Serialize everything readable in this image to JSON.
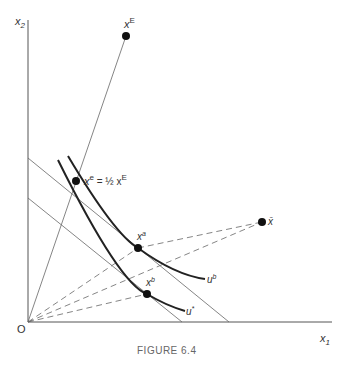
{
  "figure": {
    "caption": "FIGURE 6.4",
    "axes": {
      "origin_label": "O",
      "x_label": "x",
      "x_sub": "1",
      "y_label": "x",
      "y_sub": "2"
    },
    "points": {
      "xE": {
        "label": "x",
        "sup": "E"
      },
      "xe": {
        "label": "x",
        "sup": "e",
        "eq": " = ½ x",
        "eq_sup": "E"
      },
      "xa": {
        "label": "x",
        "sup": "a"
      },
      "xb": {
        "label": "x",
        "sup": "b"
      },
      "xbar": {
        "label": "x̄"
      }
    },
    "curves": {
      "ub": {
        "label": "u",
        "sup": "b"
      },
      "ustar": {
        "label": "u",
        "sup": "*"
      }
    }
  },
  "colors": {
    "ink": "#222222",
    "thin": "#555555"
  }
}
